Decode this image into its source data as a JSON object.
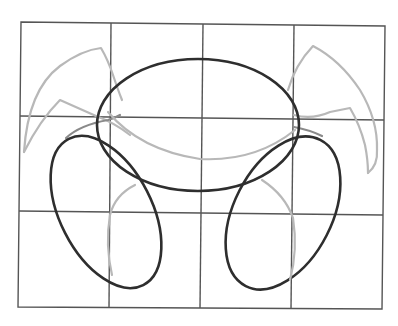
{
  "drawing": {
    "description": "Pencil construction sketch on a 4x3 grid: a central oval body, two tilted oval limbs below, and light claw-like arcs on each side",
    "grid": {
      "columns": 4,
      "rows": 3,
      "line_color": "#555555"
    },
    "colors": {
      "dark_stroke": "#2e2e2e",
      "light_stroke": "#b8b8b8",
      "mid_stroke": "#8a8a8a",
      "background": "#ffffff"
    },
    "shapes": [
      {
        "name": "central-oval",
        "tone": "dark"
      },
      {
        "name": "left-tilted-oval",
        "tone": "dark"
      },
      {
        "name": "right-tilted-oval",
        "tone": "dark"
      },
      {
        "name": "left-claw-arc",
        "tone": "light"
      },
      {
        "name": "right-claw-arc",
        "tone": "light"
      },
      {
        "name": "inner-belly-arc",
        "tone": "light"
      },
      {
        "name": "left-inner-leg-arc",
        "tone": "light"
      },
      {
        "name": "right-inner-leg-arc",
        "tone": "light"
      }
    ]
  }
}
